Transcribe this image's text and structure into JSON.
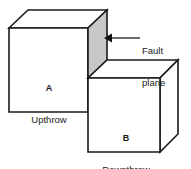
{
  "figure": {
    "type": "geological-fault-block-diagram",
    "background_color": "#ffffff",
    "line_color": "#1a1a1a",
    "fault_plane_color": "#c8c8c8",
    "width": 191,
    "height": 169
  },
  "blocks": [
    {
      "tag": "A",
      "name": "Upthrow",
      "position": "left-raised"
    },
    {
      "tag": "B",
      "name": "Downthrow",
      "position": "right-lowered"
    }
  ],
  "annotations": {
    "fault_plane": {
      "line1": "Fault",
      "line2": "plane",
      "arrow_direction": "left",
      "points_to": "fault-plane-face"
    }
  },
  "caption": {
    "text": ""
  }
}
